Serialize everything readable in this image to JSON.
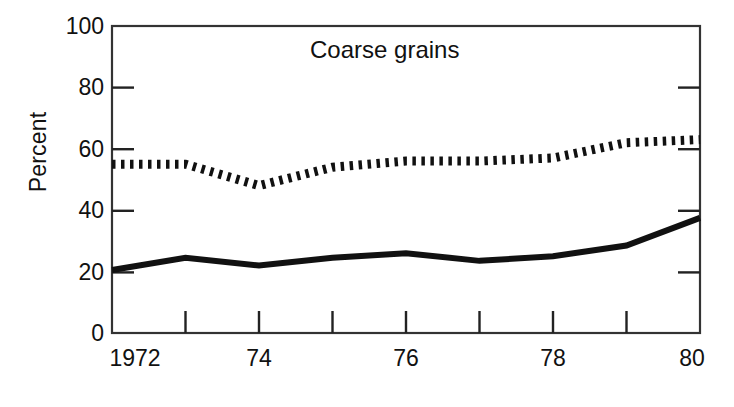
{
  "chart_data": {
    "type": "line",
    "title": "Coarse grains",
    "xlabel": "",
    "ylabel": "Percent",
    "x": [
      1972,
      1973,
      1974,
      1975,
      1976,
      1977,
      1978,
      1979,
      1980
    ],
    "xtick_labels": [
      "1972",
      "",
      "74",
      "",
      "76",
      "",
      "78",
      "",
      "80"
    ],
    "xlim": [
      1972,
      1980
    ],
    "ylim": [
      0,
      100
    ],
    "ytick_labels": [
      "0",
      "20",
      "40",
      "60",
      "80",
      "100"
    ],
    "yticks": [
      0,
      20,
      40,
      60,
      80,
      100
    ],
    "grid": false,
    "legend_position": "none",
    "series": [
      {
        "name": "dotted-series",
        "style": "dotted",
        "values": [
          55,
          55,
          48,
          54,
          56,
          56,
          57,
          62,
          63
        ]
      },
      {
        "name": "solid-series",
        "style": "solid",
        "values": [
          20.5,
          24.5,
          22,
          24.5,
          26,
          23.5,
          25,
          28.5,
          37.5
        ]
      }
    ],
    "colors": {
      "line": "#111111",
      "axis": "#333333",
      "background": "#ffffff"
    }
  }
}
